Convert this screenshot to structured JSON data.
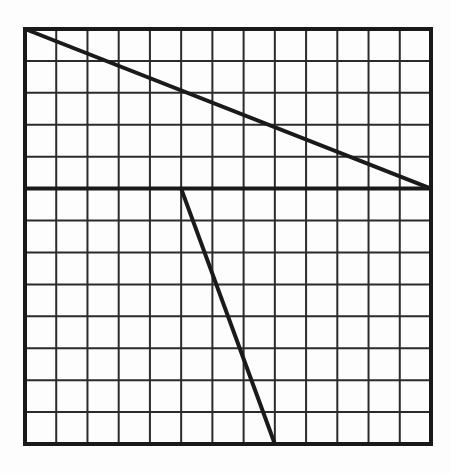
{
  "diagram": {
    "type": "grid-line-figure",
    "background_color": "#fdfdfd",
    "grid": {
      "columns": 13,
      "rows": 13,
      "origin_px": [
        25,
        29
      ],
      "size_px": [
        406,
        415
      ],
      "line_color": "#2b2b2b",
      "line_width": 2,
      "border_color": "#1a1a1a",
      "border_width": 4
    },
    "segments": [
      {
        "name": "horizontal-line",
        "from": [
          0,
          5
        ],
        "to": [
          13,
          5
        ],
        "color": "#1a1a1a",
        "width": 4
      },
      {
        "name": "diagonal-line",
        "from": [
          0,
          0
        ],
        "to": [
          13,
          5
        ],
        "color": "#1a1a1a",
        "width": 4
      },
      {
        "name": "slanted-line",
        "from": [
          5,
          5
        ],
        "to": [
          8,
          13
        ],
        "color": "#1a1a1a",
        "width": 4
      }
    ]
  }
}
